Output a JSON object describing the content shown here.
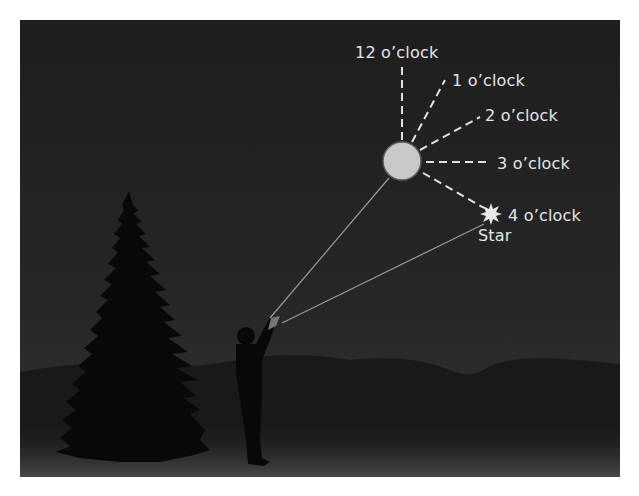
{
  "diagram": {
    "labels": {
      "twelve": "12 o’clock",
      "one": "1 o’clock",
      "two": "2 o’clock",
      "three": "3 o’clock",
      "four": "4 o’clock",
      "star": "Star"
    },
    "elements": [
      "moon",
      "star",
      "tree",
      "person",
      "mountains",
      "sight-lines",
      "clock-direction-lines"
    ],
    "colors": {
      "sky": "#222222",
      "moon": "#c8c8c8",
      "text": "#e6e6e6",
      "silhouette": "#0a0a0a"
    }
  }
}
